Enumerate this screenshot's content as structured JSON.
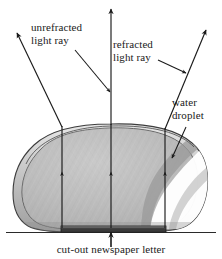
{
  "figure": {
    "background_color": "#ffffff",
    "ink_color": "#1a1a1a",
    "droplet_fill_color": "#b9b9b9",
    "droplet_highlight_color": "#ffffff",
    "letter_color": "#3a3a3a",
    "labels": {
      "unrefracted_ray": {
        "line1": "unrefracted",
        "line2": "light ray"
      },
      "refracted_ray": {
        "line1": "refracted",
        "line2": "light  ray"
      },
      "water_droplet": {
        "line1": "water",
        "line2": "droplet"
      },
      "caption": "cut-out newspaper letter"
    },
    "elements": {
      "unrefracted_ray_name": "unrefracted light ray",
      "refracted_ray_left_name": "refracted light ray left",
      "refracted_ray_right_name": "refracted light ray right",
      "droplet_name": "water droplet",
      "letter_name": "cut-out newspaper letter",
      "ground_name": "surface line"
    }
  }
}
